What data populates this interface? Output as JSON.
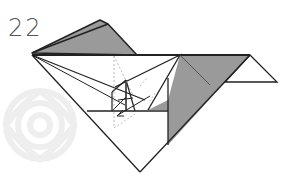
{
  "step": {
    "number": "22"
  },
  "diagram": {
    "type": "origami-fold-step",
    "colors": {
      "paper_front": "#ffffff",
      "paper_back": "#999999",
      "line": "#222222",
      "fold_line": "#aaaaaa",
      "watermark": "#f2f2f2"
    }
  }
}
